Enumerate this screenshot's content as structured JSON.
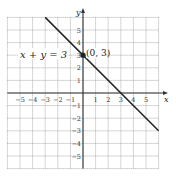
{
  "chart_data": {
    "type": "line",
    "title": "",
    "xlabel": "x",
    "ylabel": "y",
    "xlim": [
      -6,
      6
    ],
    "ylim": [
      -6,
      6
    ],
    "grid": true,
    "x_ticks": [
      -5,
      -4,
      -3,
      -2,
      -1,
      1,
      2,
      3,
      4,
      5
    ],
    "y_ticks": [
      5,
      4,
      3,
      2,
      1,
      -1,
      -2,
      -3,
      -4,
      -5
    ],
    "series": [
      {
        "name": "x + y = 3",
        "equation": "x + y = 3",
        "x": [
          -3,
          6
        ],
        "y": [
          6,
          -3
        ],
        "color": "#222222"
      }
    ],
    "annotations": [
      {
        "label": "(0, 3)",
        "x": 0,
        "y": 3,
        "marker": "point"
      },
      {
        "label": "x + y = 3",
        "position": "left of line near y=3"
      }
    ]
  },
  "labels": {
    "x_axis": "x",
    "y_axis": "y",
    "equation": "x + y = 3",
    "point": "(0, 3)"
  }
}
